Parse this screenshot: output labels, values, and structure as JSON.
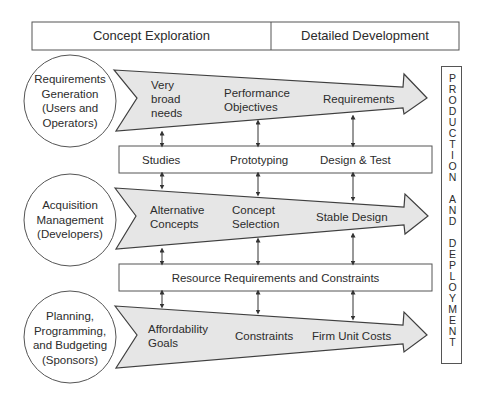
{
  "header": {
    "phases": [
      {
        "label": "Concept Exploration"
      },
      {
        "label": "Detailed Development"
      }
    ]
  },
  "rows": [
    {
      "actor": {
        "lines": [
          "Requirements",
          "Generation",
          "(Users and",
          "Operators)"
        ]
      },
      "arrow_items": [
        {
          "lines": [
            "Very",
            "broad",
            "needs"
          ]
        },
        {
          "lines": [
            "Performance",
            "Objectives"
          ]
        },
        {
          "lines": [
            "Requirements"
          ]
        }
      ]
    },
    {
      "actor": {
        "lines": [
          "Acquisition",
          "Management",
          "(Developers)"
        ]
      },
      "arrow_items": [
        {
          "lines": [
            "Alternative",
            "Concepts"
          ]
        },
        {
          "lines": [
            "Concept",
            "Selection"
          ]
        },
        {
          "lines": [
            "Stable Design"
          ]
        }
      ]
    },
    {
      "actor": {
        "lines": [
          "Planning,",
          "Programming,",
          "and Budgeting",
          "(Sponsors)"
        ]
      },
      "arrow_items": [
        {
          "lines": [
            "Affordability",
            "Goals"
          ]
        },
        {
          "lines": [
            "Constraints"
          ]
        },
        {
          "lines": [
            "Firm Unit Costs"
          ]
        }
      ]
    }
  ],
  "linking_boxes": [
    {
      "items": [
        "Studies",
        "Prototyping",
        "Design & Test"
      ]
    },
    {
      "items": [
        "Resource Requirements and Constraints"
      ]
    }
  ],
  "side_box": {
    "letters": [
      "P",
      "R",
      "O",
      "D",
      "U",
      "C",
      "T",
      "I",
      "O",
      "N",
      "",
      "A",
      "N",
      "D",
      "",
      "D",
      "E",
      "P",
      "L",
      "O",
      "Y",
      "M",
      "E",
      "N",
      "T"
    ]
  },
  "colors": {
    "arrow_fill": "#e6e6e6",
    "stroke": "#4a4a4a",
    "text": "#2c2c2c",
    "background": "#ffffff"
  }
}
